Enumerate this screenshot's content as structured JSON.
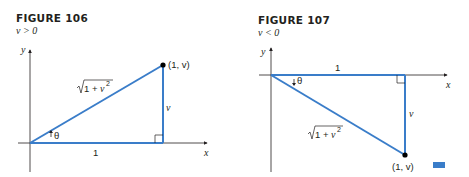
{
  "figures": [
    {
      "title": "FIGURE 106",
      "condition": "v > 0",
      "labels": {
        "y_axis": "y",
        "x_axis": "x",
        "point": "(1, v)",
        "hypotenuse": "√1 + v²",
        "hyp_radicand": "1 + v",
        "hyp_exp": "2",
        "vertical_side": "v",
        "horizontal_side": "1",
        "angle": "θ"
      }
    },
    {
      "title": "FIGURE 107",
      "condition": "v < 0",
      "labels": {
        "y_axis": "y",
        "x_axis": "x",
        "point": "(1, v)",
        "hypotenuse": "√1 + v²",
        "hyp_radicand": "1 + v",
        "hyp_exp": "2",
        "vertical_side": "v",
        "horizontal_side": "1",
        "angle": "θ"
      }
    }
  ],
  "colors": {
    "triangle": "#3a7dc9",
    "axis": "#231f20",
    "end_mark": "#3a7dc9"
  }
}
